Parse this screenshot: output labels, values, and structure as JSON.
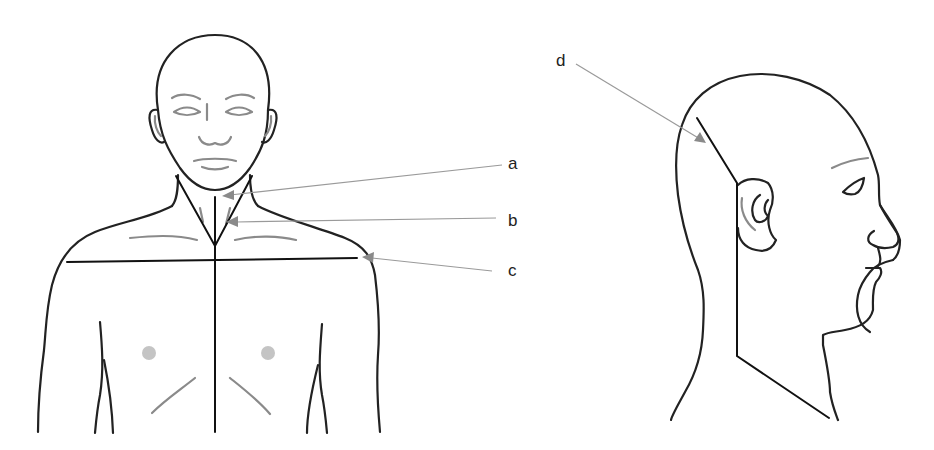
{
  "figure": {
    "title": "",
    "views": [
      "front-view",
      "side-profile-view"
    ],
    "colors": {
      "outline": "#222222",
      "detail": "#8a8a8a",
      "leader": "#9a9a9a",
      "background": "#ffffff"
    }
  },
  "labels": {
    "a": "a",
    "b": "b",
    "c": "c",
    "d": "d"
  }
}
